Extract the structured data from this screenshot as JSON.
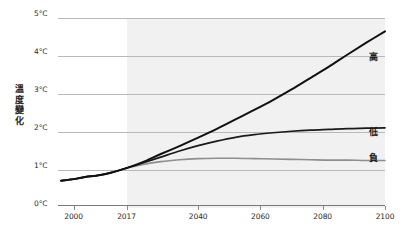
{
  "chart_data": {
    "type": "line",
    "title": "",
    "xlabel": "",
    "ylabel": "溫度變化",
    "xlim": [
      1995,
      2100
    ],
    "ylim": [
      0,
      5
    ],
    "grid": true,
    "legend_position": "right-inline",
    "x_ticks": [
      "2000",
      "2017",
      "2040",
      "2060",
      "2080",
      "2100"
    ],
    "x_tick_values": [
      2000,
      2017,
      2040,
      2060,
      2080,
      2100
    ],
    "y_ticks": [
      "0°C",
      "1°C",
      "2°C",
      "3°C",
      "4°C",
      "5°C"
    ],
    "y_tick_values": [
      0,
      1,
      2,
      3,
      4,
      5
    ],
    "shaded_region": {
      "label": "projection",
      "from": 2017,
      "to": 2100,
      "color": "#eeeeee"
    },
    "series": [
      {
        "name": "高",
        "color": "#111111",
        "width": 2.0,
        "x": [
          1996,
          2000,
          2004,
          2008,
          2012,
          2017,
          2022,
          2028,
          2034,
          2040,
          2046,
          2052,
          2058,
          2064,
          2070,
          2076,
          2082,
          2088,
          2094,
          2100
        ],
        "values": [
          0.72,
          0.76,
          0.82,
          0.86,
          0.93,
          1.05,
          1.2,
          1.42,
          1.63,
          1.85,
          2.08,
          2.33,
          2.58,
          2.84,
          3.12,
          3.42,
          3.72,
          4.04,
          4.35,
          4.65
        ]
      },
      {
        "name": "低",
        "color": "#1a1a1a",
        "width": 1.7,
        "x": [
          1996,
          2000,
          2004,
          2008,
          2012,
          2017,
          2022,
          2028,
          2034,
          2040,
          2046,
          2052,
          2058,
          2064,
          2070,
          2076,
          2082,
          2088,
          2094,
          2100
        ],
        "values": [
          0.72,
          0.76,
          0.82,
          0.86,
          0.93,
          1.05,
          1.18,
          1.34,
          1.5,
          1.64,
          1.76,
          1.86,
          1.93,
          1.98,
          2.02,
          2.05,
          2.07,
          2.09,
          2.1,
          2.11
        ]
      },
      {
        "name": "負",
        "color": "#8e8e8e",
        "width": 1.6,
        "x": [
          1996,
          2000,
          2004,
          2008,
          2012,
          2017,
          2022,
          2028,
          2034,
          2040,
          2046,
          2052,
          2058,
          2064,
          2070,
          2076,
          2082,
          2088,
          2094,
          2100
        ],
        "values": [
          0.72,
          0.76,
          0.82,
          0.86,
          0.93,
          1.05,
          1.14,
          1.22,
          1.27,
          1.3,
          1.31,
          1.31,
          1.3,
          1.29,
          1.28,
          1.27,
          1.26,
          1.26,
          1.25,
          1.25
        ]
      }
    ],
    "series_labels": [
      {
        "text": "高",
        "x_px": 369,
        "y_px": 50
      },
      {
        "text": "低",
        "x_px": 369,
        "y_px": 125
      },
      {
        "text": "負",
        "x_px": 369,
        "y_px": 151
      }
    ]
  }
}
